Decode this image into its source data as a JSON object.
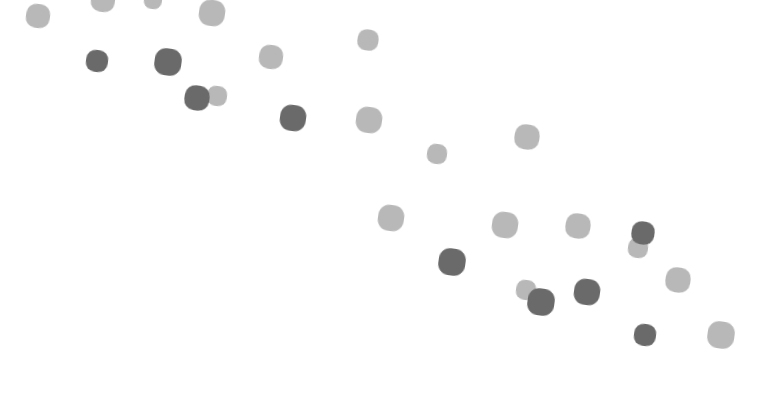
{
  "chart_data": {
    "type": "scatter",
    "title": "",
    "xlabel": "",
    "ylabel": "",
    "grid": false,
    "legend": null,
    "axes_visible": false,
    "xlim": [
      0,
      765
    ],
    "ylim": [
      395,
      0
    ],
    "colors": {
      "light": "#b8b8b8",
      "dark": "#6a6a6a"
    },
    "series": [
      {
        "name": "light",
        "points": [
          {
            "x": 38,
            "y": 16,
            "size": 24
          },
          {
            "x": 103,
            "y": 0,
            "size": 24
          },
          {
            "x": 153,
            "y": 0,
            "size": 18
          },
          {
            "x": 212,
            "y": 13,
            "size": 26
          },
          {
            "x": 271,
            "y": 57,
            "size": 24
          },
          {
            "x": 368,
            "y": 40,
            "size": 21
          },
          {
            "x": 217,
            "y": 96,
            "size": 20
          },
          {
            "x": 369,
            "y": 120,
            "size": 26
          },
          {
            "x": 437,
            "y": 154,
            "size": 20
          },
          {
            "x": 527,
            "y": 137,
            "size": 25
          },
          {
            "x": 391,
            "y": 218,
            "size": 26
          },
          {
            "x": 505,
            "y": 225,
            "size": 26
          },
          {
            "x": 578,
            "y": 226,
            "size": 25
          },
          {
            "x": 638,
            "y": 248,
            "size": 20
          },
          {
            "x": 678,
            "y": 280,
            "size": 25
          },
          {
            "x": 526,
            "y": 290,
            "size": 20
          },
          {
            "x": 721,
            "y": 335,
            "size": 27
          }
        ]
      },
      {
        "name": "dark",
        "points": [
          {
            "x": 97,
            "y": 61,
            "size": 22
          },
          {
            "x": 168,
            "y": 62,
            "size": 27
          },
          {
            "x": 197,
            "y": 98,
            "size": 25
          },
          {
            "x": 293,
            "y": 118,
            "size": 26
          },
          {
            "x": 452,
            "y": 262,
            "size": 27
          },
          {
            "x": 643,
            "y": 233,
            "size": 23
          },
          {
            "x": 541,
            "y": 302,
            "size": 27
          },
          {
            "x": 587,
            "y": 292,
            "size": 26
          },
          {
            "x": 645,
            "y": 335,
            "size": 22
          }
        ]
      }
    ]
  }
}
